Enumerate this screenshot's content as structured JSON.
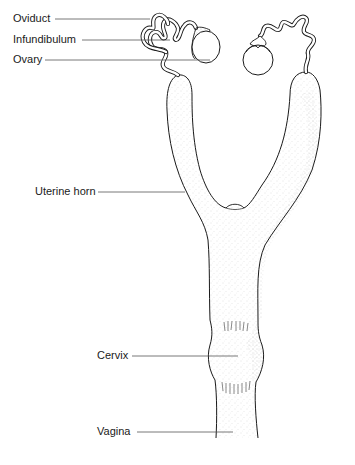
{
  "diagram": {
    "labels": [
      {
        "id": "oviduct",
        "text": "Oviduct",
        "x": 13,
        "y": 13,
        "leader_to": [
          150,
          19
        ]
      },
      {
        "id": "infundibulum",
        "text": "Infundibulum",
        "x": 13,
        "y": 33,
        "leader_to": [
          170,
          40
        ]
      },
      {
        "id": "ovary",
        "text": "Ovary",
        "x": 13,
        "y": 53,
        "leader_to": [
          188,
          60
        ]
      },
      {
        "id": "uterine-horn",
        "text": "Uterine horn",
        "x": 35,
        "y": 185,
        "leader_to": [
          185,
          192
        ]
      },
      {
        "id": "cervix",
        "text": "Cervix",
        "x": 100,
        "y": 349,
        "leader_to": [
          238,
          356
        ]
      },
      {
        "id": "vagina",
        "text": "Vagina",
        "x": 100,
        "y": 426,
        "leader_to": [
          233,
          432
        ]
      }
    ],
    "colors": {
      "ink": "#1a1a1a",
      "leader": "#555555",
      "stipple": "#9a9a9a",
      "background": "#ffffff"
    }
  }
}
